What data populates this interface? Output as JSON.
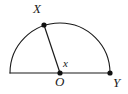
{
  "figure": {
    "type": "geometry-diagram",
    "background_color": "#ffffff",
    "stroke_color": "#1a1a1a",
    "point_color": "#111111",
    "stroke_width": 1.1,
    "canvas": {
      "width": 128,
      "height": 94
    },
    "geometry": {
      "center": {
        "x": 60,
        "y": 73
      },
      "radius": 50,
      "baseline_y": 73,
      "diameter_left_end": {
        "x": 10,
        "y": 73
      },
      "diameter_right_end": {
        "x": 110,
        "y": 73
      },
      "arc_start_angle_deg": 180,
      "arc_end_angle_deg": 0,
      "point_X": {
        "x": 44,
        "y": 25
      },
      "radius_OX_angle_deg": 108
    },
    "points": [
      {
        "id": "X",
        "label": "X",
        "cx": 44,
        "cy": 25,
        "r": 2.6
      },
      {
        "id": "O",
        "label": "O",
        "cx": 60,
        "cy": 73,
        "r": 2.6
      },
      {
        "id": "Y",
        "label": "Y",
        "cx": 110,
        "cy": 73,
        "r": 2.6
      }
    ],
    "labels": {
      "vertex_X": "X",
      "vertex_O": "O",
      "vertex_Y": "Y",
      "angle": "x"
    }
  }
}
